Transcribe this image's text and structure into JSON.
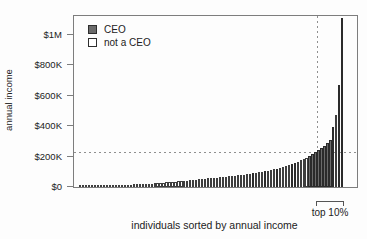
{
  "figure": {
    "ylabel": "annual income",
    "xlabel": "individuals sorted by annual income",
    "top_decile_label": "top 10%",
    "legend": [
      {
        "label": "CEO",
        "filled": true,
        "swatch_color": "#6b6b6b"
      },
      {
        "label": "not a CEO",
        "filled": false,
        "swatch_color": "#ffffff"
      }
    ]
  },
  "colors": {
    "ceo_bar": "#6b6b6b",
    "non_ceo_bar": "#ffffff",
    "bar_border": "#3e3e3e",
    "axis_box": "#7d7d7d",
    "dashed_line": "#8f8f8f",
    "text": "#222222"
  },
  "chart_data": {
    "type": "bar",
    "title": "",
    "xlabel": "individuals sorted by annual income",
    "ylabel": "annual income",
    "legend": [
      "CEO",
      "not a CEO"
    ],
    "legend_position": "top-left-inside",
    "grid": false,
    "n_individuals": 89,
    "ylim_usd": [
      0,
      1120000
    ],
    "yticks": [
      {
        "label": "$0",
        "value_k": 0
      },
      {
        "label": "$200K",
        "value_k": 200
      },
      {
        "label": "$400K",
        "value_k": 400
      },
      {
        "label": "$600K",
        "value_k": 600
      },
      {
        "label": "$800K",
        "value_k": 800
      },
      {
        "label": "$1M",
        "value_k": 1000
      }
    ],
    "values_usd_k": [
      4,
      5,
      5,
      6,
      6,
      7,
      7,
      8,
      9,
      9,
      10,
      11,
      11,
      12,
      13,
      14,
      15,
      16,
      17,
      18,
      19,
      20,
      21,
      22,
      23,
      25,
      26,
      27,
      29,
      30,
      32,
      33,
      35,
      37,
      38,
      40,
      42,
      44,
      46,
      48,
      50,
      52,
      54,
      56,
      58,
      60,
      62,
      64,
      66,
      68,
      70,
      72,
      74,
      77,
      79,
      82,
      85,
      88,
      91,
      94,
      97,
      100,
      104,
      108,
      112,
      116,
      121,
      126,
      132,
      138,
      144,
      151,
      158,
      166,
      174,
      183,
      193,
      204,
      216,
      228,
      242,
      256,
      270,
      286,
      310,
      395,
      470,
      670,
      1110
    ],
    "ceo_indices": [
      58,
      62,
      66,
      71,
      72,
      77,
      78,
      79,
      80,
      81,
      82,
      83,
      84,
      85,
      87,
      88
    ],
    "reference_lines": {
      "horizontal_income_usd_k": 230,
      "vertical_at_top_decile_start_index": 80
    },
    "annotation": {
      "label": "top 10%",
      "covers": "highest-earning 10% of individuals"
    }
  }
}
